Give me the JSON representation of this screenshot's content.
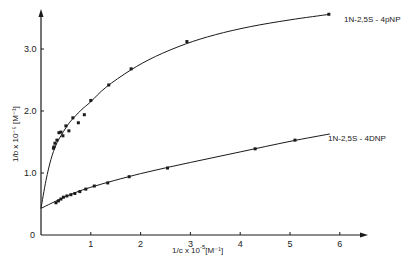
{
  "chart_data": {
    "type": "scatter",
    "title": "",
    "xlabel": "1/c x 10⁻⁵ [M⁻¹]",
    "ylabel": "1/b x 10⁻⁵ [M⁻¹]",
    "xlim": [
      0,
      6.5
    ],
    "ylim": [
      0,
      3.6
    ],
    "x_ticks": [
      "1",
      "2",
      "3",
      "4",
      "5",
      "6"
    ],
    "y_ticks": [
      "0",
      "1.0",
      "2.0",
      "3.0"
    ],
    "grid": false,
    "legend_position": "inline labels at right end of curves",
    "series": [
      {
        "name": "1N-2,5S - 4pNP",
        "x": [
          0.25,
          0.26,
          0.28,
          0.32,
          0.36,
          0.4,
          0.44,
          0.5,
          0.56,
          0.64,
          0.75,
          0.87,
          1.0,
          1.36,
          1.81,
          2.93,
          5.78
        ],
        "y": [
          1.4,
          1.42,
          1.48,
          1.53,
          1.65,
          1.66,
          1.6,
          1.76,
          1.68,
          1.89,
          1.81,
          1.94,
          2.17,
          2.42,
          2.68,
          3.12,
          3.56
        ],
        "fit": "curve",
        "fit_x": [
          0,
          0.1,
          0.2,
          0.3,
          0.4,
          0.5,
          0.6,
          0.8,
          1.0,
          1.3,
          1.8,
          2.3,
          2.9,
          3.5,
          4.2,
          5.0,
          5.8
        ],
        "fit_y": [
          0.43,
          0.88,
          1.22,
          1.45,
          1.6,
          1.73,
          1.84,
          2.01,
          2.15,
          2.38,
          2.66,
          2.88,
          3.08,
          3.23,
          3.36,
          3.47,
          3.56
        ]
      },
      {
        "name": "1N-2,5S - 4DNP",
        "x": [
          0.3,
          0.35,
          0.4,
          0.45,
          0.52,
          0.6,
          0.68,
          0.78,
          0.9,
          1.07,
          1.34,
          1.77,
          2.54,
          4.3,
          5.1
        ],
        "y": [
          0.52,
          0.55,
          0.58,
          0.61,
          0.63,
          0.65,
          0.67,
          0.7,
          0.74,
          0.79,
          0.84,
          0.94,
          1.08,
          1.39,
          1.53
        ],
        "fit": "curve",
        "fit_x": [
          0,
          0.5,
          1.0,
          2.0,
          3.0,
          4.0,
          5.0,
          5.8
        ],
        "fit_y": [
          0.43,
          0.62,
          0.77,
          0.99,
          1.17,
          1.34,
          1.51,
          1.63
        ]
      }
    ]
  },
  "labels": {
    "x_axis": "1/c x 10",
    "x_axis_exp": "-5",
    "x_axis_unit": "[M⁻¹]",
    "y_axis": "1/b x 10⁻⁵ [M⁻¹]",
    "series_1": "1N-2,5S - 4pNP",
    "series_2": "1N-2,5S - 4DNP",
    "origin": "0"
  },
  "style": {
    "ink": "#1a1a1a",
    "background": "#ffffff"
  }
}
